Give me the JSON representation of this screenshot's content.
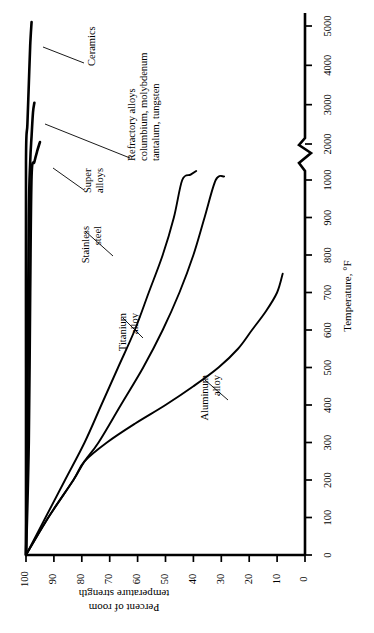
{
  "chart_data": {
    "type": "line",
    "title": "",
    "orientation": "rotated-90-ccw",
    "xlabel": "Temperature, °F",
    "ylabel": "Percent of room temperature strength",
    "xlim": [
      0,
      5200
    ],
    "ylim": [
      0,
      103
    ],
    "grid": false,
    "legend": "none (curves labelled in-place with leader lines)",
    "axis_break": {
      "from": 1000,
      "to": 2000,
      "style": "zigzag"
    },
    "xticks": [
      0,
      100,
      200,
      300,
      400,
      500,
      600,
      700,
      800,
      900,
      1000,
      2000,
      3000,
      4000,
      5000
    ],
    "xticklabels": [
      "0",
      "100",
      "200",
      "300",
      "400",
      "500",
      "600",
      "700",
      "800",
      "900",
      "1000",
      "2000",
      "3000",
      "4000",
      "5000"
    ],
    "yticks": [
      0,
      10,
      20,
      30,
      40,
      50,
      60,
      70,
      80,
      90,
      100
    ],
    "yticklabels": [
      "0",
      "10",
      "20",
      "30",
      "40",
      "50",
      "60",
      "70",
      "80",
      "90",
      "100"
    ],
    "series": [
      {
        "name": "Ceramics",
        "label": "Ceramics",
        "x": [
          0,
          500,
          1500,
          2500,
          3500,
          4500,
          5100
        ],
        "y": [
          100,
          100,
          100,
          99.5,
          99,
          98.5,
          98
        ]
      },
      {
        "name": "Refractory alloys",
        "label": "Refractory alloys\ncolumbium, molybdenum\ntantalum, tungsten",
        "label_lines": [
          "Refractory alloys",
          "columbium, molybdenum",
          "tantalum, tungsten"
        ],
        "x": [
          0,
          400,
          900,
          1500,
          2200,
          2800,
          3050
        ],
        "y": [
          100,
          99.5,
          99,
          98.5,
          98,
          97.5,
          97
        ]
      },
      {
        "name": "Super alloys",
        "label": "Super alloys",
        "label_lines": [
          "Super",
          "alloys"
        ],
        "x": [
          0,
          300,
          700,
          1100,
          1500,
          1800,
          2050
        ],
        "y": [
          100,
          99,
          98.5,
          98,
          97,
          96,
          95
        ]
      },
      {
        "name": "Stainless steel",
        "label": "Stainless steel",
        "label_lines": [
          "Stainless",
          "steel"
        ],
        "x": [
          0,
          100,
          200,
          300,
          400,
          500,
          600,
          700,
          800,
          900,
          1000,
          1150,
          1250
        ],
        "y": [
          100,
          93,
          86,
          79,
          73,
          67,
          61,
          56,
          51,
          47,
          44,
          41,
          39
        ]
      },
      {
        "name": "Titanium alloy",
        "label": "Titanium alloy",
        "label_lines": [
          "Titanium",
          "alloy"
        ],
        "x": [
          0,
          100,
          200,
          250,
          300,
          400,
          500,
          600,
          700,
          800,
          900,
          1000,
          1100
        ],
        "y": [
          100,
          92,
          83,
          79,
          74,
          66,
          58,
          51,
          45,
          40,
          36,
          32,
          29
        ]
      },
      {
        "name": "Aluminum alloy",
        "label": "Aluminum alloy",
        "label_lines": [
          "Aluminum",
          "alloy"
        ],
        "x": [
          0,
          100,
          200,
          250,
          300,
          350,
          400,
          450,
          500,
          550,
          600,
          650,
          700,
          750
        ],
        "y": [
          100,
          92,
          83,
          79,
          71,
          61,
          50,
          40,
          31,
          24,
          19,
          14,
          10,
          8
        ]
      }
    ]
  },
  "axes": {
    "x_axis_title": "Temperature, °F",
    "y_axis_title_lines": [
      "Percent of room",
      "temperature strength"
    ],
    "x_tick_labels": [
      "0",
      "100",
      "200",
      "300",
      "400",
      "500",
      "600",
      "700",
      "800",
      "900",
      "1000",
      "2000",
      "3000",
      "4000",
      "5000"
    ],
    "y_tick_labels": [
      "100",
      "90",
      "80",
      "70",
      "60",
      "50",
      "40",
      "30",
      "20",
      "10",
      "0"
    ]
  },
  "annotations": {
    "ceramics": "Ceramics",
    "refractory_line1": "Refractory alloys",
    "refractory_line2": "columbium, molybdenum",
    "refractory_line3": "tantalum, tungsten",
    "super_line1": "Super",
    "super_line2": "alloys",
    "stainless_line1": "Stainless",
    "stainless_line2": "steel",
    "titanium_line1": "Titanium",
    "titanium_line2": "alloy",
    "aluminum_line1": "Aluminum",
    "aluminum_line2": "alloy"
  },
  "style": {
    "ink": "#000000",
    "paper": "#ffffff"
  }
}
